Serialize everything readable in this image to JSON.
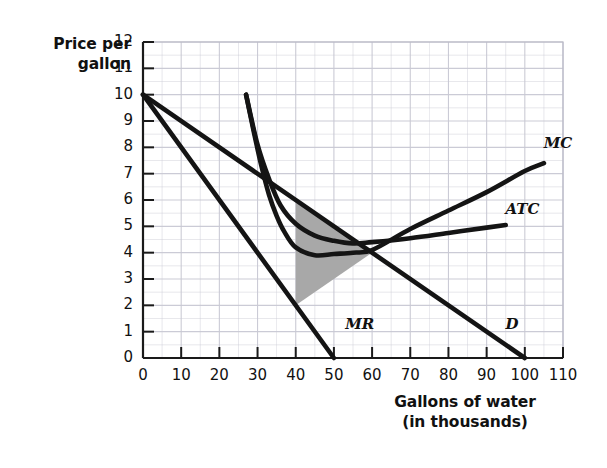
{
  "chart_data": {
    "type": "line",
    "title": "",
    "xlabel": "Gallons of water (in thousands)",
    "xlabel_line1": "Gallons of water",
    "xlabel_line2": "(in thousands)",
    "ylabel": "Price per gallon",
    "ylabel_line1": "Price per",
    "ylabel_line2": "gallon",
    "xlim": [
      0,
      110
    ],
    "ylim": [
      0,
      12
    ],
    "xticks": [
      0,
      10,
      20,
      30,
      40,
      50,
      60,
      70,
      80,
      90,
      100,
      110
    ],
    "yticks": [
      0,
      1,
      2,
      3,
      4,
      5,
      6,
      7,
      8,
      9,
      10,
      11,
      12
    ],
    "grid": true,
    "grid_color": "#c9c9d4",
    "legend_position": "inline-curve-labels",
    "series": [
      {
        "name": "D",
        "label": "D",
        "description": "Demand curve, linear from (0,10) to (100,0)",
        "points": [
          [
            0,
            10
          ],
          [
            100,
            0
          ]
        ],
        "label_x": 96,
        "label_y": 1.2,
        "color": "#141414"
      },
      {
        "name": "MR",
        "label": "MR",
        "description": "Marginal revenue, linear from (0,10) to (50,0)",
        "points": [
          [
            0,
            10
          ],
          [
            50,
            0
          ]
        ],
        "label_x": 54,
        "label_y": 1.2,
        "color": "#141414"
      },
      {
        "name": "MC",
        "label": "MC",
        "description": "Marginal cost, U-shaped falling from (27,10) to minimum near (40,4) then rising to (105,7.4)",
        "points": [
          [
            27,
            10
          ],
          [
            29,
            8.6
          ],
          [
            31,
            7.3
          ],
          [
            33,
            6.2
          ],
          [
            35,
            5.4
          ],
          [
            37,
            4.8
          ],
          [
            40,
            4.2
          ],
          [
            45,
            3.9
          ],
          [
            50,
            3.95
          ],
          [
            55,
            4.0
          ],
          [
            60,
            4.1
          ],
          [
            70,
            4.9
          ],
          [
            80,
            5.6
          ],
          [
            90,
            6.3
          ],
          [
            100,
            7.1
          ],
          [
            105,
            7.4
          ]
        ],
        "label_x": 106,
        "label_y": 8.1,
        "color": "#141414"
      },
      {
        "name": "ATC",
        "label": "ATC",
        "description": "Average total cost, U-shaped with minimum near (45,4.6) rising to (95,5.0)",
        "points": [
          [
            27,
            10
          ],
          [
            30,
            8.1
          ],
          [
            33,
            6.8
          ],
          [
            36,
            5.8
          ],
          [
            40,
            5.1
          ],
          [
            45,
            4.65
          ],
          [
            50,
            4.45
          ],
          [
            55,
            4.35
          ],
          [
            60,
            4.4
          ],
          [
            70,
            4.55
          ],
          [
            80,
            4.75
          ],
          [
            90,
            4.95
          ],
          [
            95,
            5.05
          ]
        ],
        "label_x": 96,
        "label_y": 5.6,
        "color": "#141414"
      }
    ],
    "shaded_region": {
      "name": "deadweight-loss-triangle",
      "fill_color": "#a8a8a8",
      "vertices": [
        [
          40,
          6
        ],
        [
          40,
          2
        ],
        [
          60,
          4
        ]
      ]
    },
    "annotations": []
  }
}
